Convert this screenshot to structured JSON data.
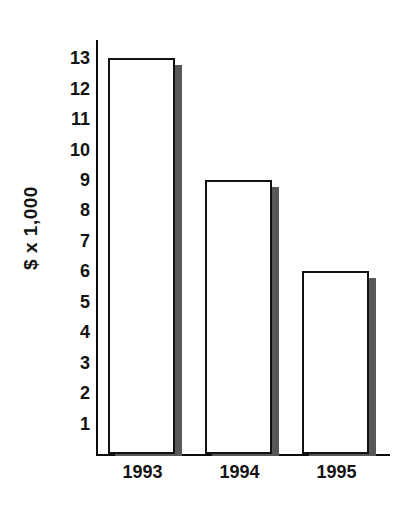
{
  "chart_data": {
    "type": "bar",
    "title": "",
    "subtitle": "",
    "xlabel": "",
    "ylabel": "$ x 1,000",
    "categories": [
      "1993",
      "1994",
      "1995"
    ],
    "values": [
      13,
      9,
      6
    ],
    "series": [
      {
        "name": "",
        "values": [
          13,
          9,
          6
        ]
      }
    ],
    "ylim": [
      0,
      13.6
    ],
    "y_tick_labels": [
      "13",
      "12",
      "11",
      "10",
      "9",
      "8",
      "7",
      "6",
      "5",
      "4",
      "3",
      "2",
      "1"
    ],
    "y_tick_values": [
      13,
      12,
      11,
      10,
      9,
      8,
      7,
      6,
      5,
      4,
      3,
      2,
      1
    ],
    "x_tick_labels": [
      "1993",
      "1994",
      "1995"
    ],
    "grid": false,
    "legend": null,
    "legend_position": "none",
    "annotations": [],
    "bar_style": {
      "fill_color": "#ffffff",
      "outline_color": "#111111",
      "shadow_color": "#58585a"
    },
    "axis_color": "#0d0d0d"
  },
  "axes": {
    "y_title": "$ x 1,000"
  }
}
